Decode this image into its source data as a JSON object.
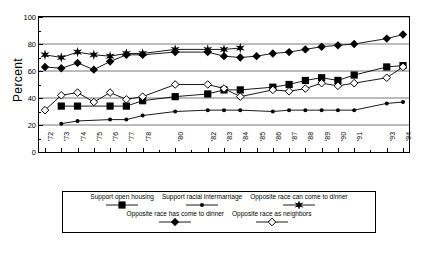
{
  "chart_data": {
    "type": "line",
    "title": "",
    "xlabel": "",
    "ylabel": "Percent",
    "ylim": [
      0,
      100
    ],
    "yticks": [
      0,
      20,
      40,
      60,
      80,
      100
    ],
    "grid": true,
    "legend_position": "bottom",
    "x": [
      "'72",
      "'73",
      "'74",
      "'75",
      "'76",
      "'77",
      "'78",
      "'80",
      "'82",
      "'83",
      "'84",
      "'85",
      "'86",
      "'87",
      "'88",
      "'89",
      "'90",
      "'91",
      "'93",
      "'94"
    ],
    "categories": [
      "'72",
      "'73",
      "'74",
      "'75",
      "'76",
      "'77",
      "'78",
      "'80",
      "'82",
      "'83",
      "'84",
      "'85",
      "'86",
      "'87",
      "'88",
      "'89",
      "'90",
      "'91",
      "'93",
      "'94"
    ],
    "series": [
      {
        "name": "Support open housing",
        "marker": "filled-square",
        "values": [
          null,
          34,
          34,
          null,
          34,
          34,
          38,
          41,
          43,
          46,
          46,
          null,
          48,
          50,
          53,
          55,
          53,
          57,
          63,
          64
        ]
      },
      {
        "name": "Support racial intermarriage",
        "marker": "small-filled-circle",
        "values": [
          null,
          21,
          23,
          null,
          24,
          24,
          27,
          30,
          31,
          31,
          31,
          null,
          30,
          31,
          31,
          31,
          31,
          31,
          36,
          37
        ]
      },
      {
        "name": "Opposite race can come to dinner",
        "marker": "star",
        "values": [
          72,
          70,
          74,
          72,
          71,
          73,
          73,
          76,
          76,
          76,
          77,
          null,
          null,
          null,
          null,
          null,
          null,
          null,
          null,
          null
        ]
      },
      {
        "name": "Opposite race has come to dinner",
        "marker": "filled-diamond",
        "values": [
          63,
          62,
          66,
          61,
          67,
          72,
          72,
          74,
          74,
          71,
          70,
          71,
          73,
          74,
          76,
          78,
          79,
          80,
          84,
          87
        ]
      },
      {
        "name": "Opposite race as neighbors",
        "marker": "open-diamond",
        "values": [
          31,
          42,
          44,
          37,
          44,
          39,
          41,
          50,
          50,
          47,
          41,
          null,
          46,
          45,
          47,
          51,
          49,
          51,
          55,
          63
        ]
      }
    ]
  },
  "axes": {
    "y_label": "Percent",
    "y_ticks": [
      "0",
      "20",
      "40",
      "60",
      "80",
      "100"
    ],
    "x_ticks": [
      "'72",
      "'73",
      "'74",
      "'75",
      "'76",
      "'77",
      "'78",
      "'80",
      "'82",
      "'83",
      "'84",
      "'85",
      "'86",
      "'87",
      "'88",
      "'89",
      "'90",
      "'91",
      "'93",
      "'94"
    ]
  },
  "legend": {
    "row1": [
      {
        "label": "Support open housing",
        "marker": "filled-square"
      },
      {
        "label": "Support racial intermarriage",
        "marker": "small-filled-circle"
      },
      {
        "label": "Opposite race can come to dinner",
        "marker": "star"
      }
    ],
    "row2": [
      {
        "label": "Opposite race has come to dinner",
        "marker": "filled-diamond"
      },
      {
        "label": "Opposite race as neighbors",
        "marker": "open-diamond"
      }
    ]
  }
}
